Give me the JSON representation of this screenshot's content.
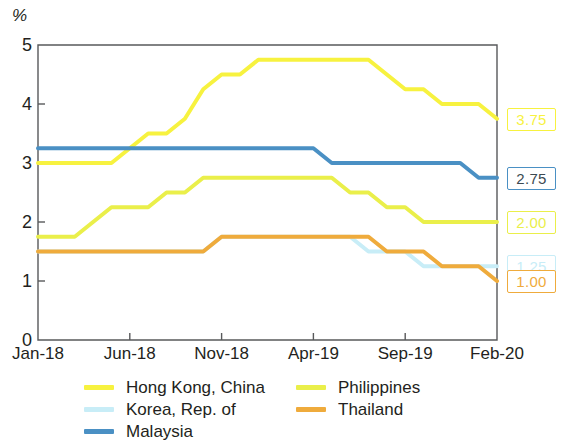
{
  "axis": {
    "unit_label": "%",
    "y_ticks": [
      "0",
      "1",
      "2",
      "3",
      "4",
      "5"
    ],
    "x_ticks": [
      "Jan-18",
      "Jun-18",
      "Nov-18",
      "Apr-19",
      "Sep-19",
      "Feb-20"
    ]
  },
  "legend": {
    "column_1": [
      {
        "label": "Hong Kong, China",
        "color": "#f7f23f"
      },
      {
        "label": "Korea, Rep. of",
        "color": "#c8edf7"
      },
      {
        "label": "Malaysia",
        "color": "#4a90c4"
      }
    ],
    "column_2": [
      {
        "label": "Philippines",
        "color": "#eaef4a"
      },
      {
        "label": "Thailand",
        "color": "#efab3c"
      }
    ]
  },
  "end_labels": [
    {
      "name": "hong-kong-china",
      "text": "3.75",
      "color": "#f7f23f",
      "value": 3.75
    },
    {
      "name": "malaysia",
      "text": "2.75",
      "color": "#4a90c4",
      "value": 2.75
    },
    {
      "name": "philippines",
      "text": "2.00",
      "color": "#eaef4a",
      "value": 2.0
    },
    {
      "name": "korea-rep-of",
      "text": "1.25",
      "color": "#c8edf7",
      "value": 1.25
    },
    {
      "name": "thailand",
      "text": "1.00",
      "color": "#efab3c",
      "value": 1.0
    }
  ],
  "chart_data": {
    "type": "line",
    "title": "",
    "xlabel": "",
    "ylabel": "%",
    "ylim": [
      0,
      5
    ],
    "grid": false,
    "legend_position": "bottom",
    "x": [
      "Jan-18",
      "Feb-18",
      "Mar-18",
      "Apr-18",
      "May-18",
      "Jun-18",
      "Jul-18",
      "Aug-18",
      "Sep-18",
      "Oct-18",
      "Nov-18",
      "Dec-18",
      "Jan-19",
      "Feb-19",
      "Mar-19",
      "Apr-19",
      "May-19",
      "Jun-19",
      "Jul-19",
      "Aug-19",
      "Sep-19",
      "Oct-19",
      "Nov-19",
      "Dec-19",
      "Jan-20",
      "Feb-20"
    ],
    "series": [
      {
        "name": "Hong Kong, China",
        "color": "#f7f23f",
        "values": [
          3.0,
          3.0,
          3.0,
          3.0,
          3.0,
          3.25,
          3.5,
          3.5,
          3.75,
          4.25,
          4.5,
          4.5,
          4.75,
          4.75,
          4.75,
          4.75,
          4.75,
          4.75,
          4.75,
          4.5,
          4.25,
          4.25,
          4.0,
          4.0,
          4.0,
          3.75
        ]
      },
      {
        "name": "Korea, Rep. of",
        "color": "#c8edf7",
        "values": [
          1.5,
          1.5,
          1.5,
          1.5,
          1.5,
          1.5,
          1.5,
          1.5,
          1.5,
          1.5,
          1.75,
          1.75,
          1.75,
          1.75,
          1.75,
          1.75,
          1.75,
          1.75,
          1.5,
          1.5,
          1.5,
          1.25,
          1.25,
          1.25,
          1.25,
          1.25
        ]
      },
      {
        "name": "Malaysia",
        "color": "#4a90c4",
        "values": [
          3.25,
          3.25,
          3.25,
          3.25,
          3.25,
          3.25,
          3.25,
          3.25,
          3.25,
          3.25,
          3.25,
          3.25,
          3.25,
          3.25,
          3.25,
          3.25,
          3.0,
          3.0,
          3.0,
          3.0,
          3.0,
          3.0,
          3.0,
          3.0,
          2.75,
          2.75
        ]
      },
      {
        "name": "Philippines",
        "color": "#eaef4a",
        "values": [
          1.75,
          1.75,
          1.75,
          2.0,
          2.25,
          2.25,
          2.25,
          2.5,
          2.5,
          2.75,
          2.75,
          2.75,
          2.75,
          2.75,
          2.75,
          2.75,
          2.75,
          2.5,
          2.5,
          2.25,
          2.25,
          2.0,
          2.0,
          2.0,
          2.0,
          2.0
        ]
      },
      {
        "name": "Thailand",
        "color": "#efab3c",
        "values": [
          1.5,
          1.5,
          1.5,
          1.5,
          1.5,
          1.5,
          1.5,
          1.5,
          1.5,
          1.5,
          1.75,
          1.75,
          1.75,
          1.75,
          1.75,
          1.75,
          1.75,
          1.75,
          1.75,
          1.5,
          1.5,
          1.5,
          1.25,
          1.25,
          1.25,
          1.0
        ]
      }
    ]
  }
}
